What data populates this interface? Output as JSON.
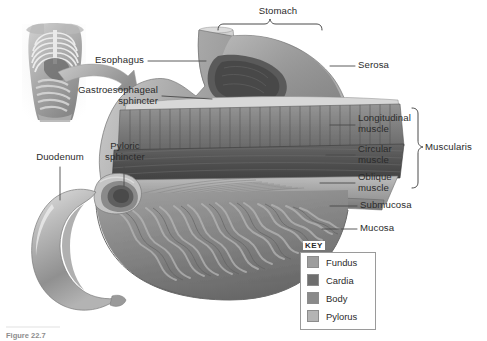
{
  "figure": {
    "title": "Stomach",
    "caption": "Figure 22.7"
  },
  "labels": {
    "stomach": "Stomach",
    "esophagus": "Esophagus",
    "gastroesophageal_sphincter": "Gastroesophageal\nsphincter",
    "duodenum": "Duodenum",
    "pyloric_sphincter": "Pyloric\nsphincter",
    "serosa": "Serosa",
    "longitudinal_muscle": "Longitudinal\nmuscle",
    "circular_muscle": "Circular\nmuscle",
    "oblique_muscle": "Oblique\nmuscle",
    "muscularis": "Muscularis",
    "submucosa": "Submucosa",
    "mucosa": "Mucosa"
  },
  "key": {
    "title": "KEY",
    "items": [
      {
        "label": "Fundus",
        "color": "#9d9d9d"
      },
      {
        "label": "Cardia",
        "color": "#6e6e6e"
      },
      {
        "label": "Body",
        "color": "#8a8a8a"
      },
      {
        "label": "Pylorus",
        "color": "#b4b4b4"
      }
    ]
  },
  "colors": {
    "background": "#ffffff",
    "text": "#2b2b2b",
    "leader_line": "#4a4a4a",
    "brace": "#4a4a4a",
    "key_border": "#9a9a9a"
  }
}
